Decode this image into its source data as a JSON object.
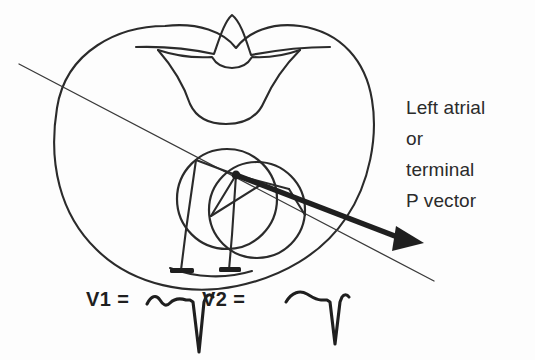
{
  "figure": {
    "background_color": "#fdfdfd",
    "ink_color": "#2b2b2b",
    "width": 535,
    "height": 360
  },
  "annotation": {
    "vector_label_lines": [
      "Left atrial",
      "or",
      "terminal",
      "P vector"
    ],
    "vector_label_text": "Left atrial or terminal P vector"
  },
  "leads": [
    {
      "name": "V1",
      "label": "V1  =",
      "electrode_position_x": 181,
      "electrode_position_y": 272,
      "waveform_description": "biphasic P wave with deep negative terminal deflection"
    },
    {
      "name": "V2",
      "label": "V2  =",
      "electrode_position_x": 229,
      "electrode_position_y": 272,
      "waveform_description": "rounded upright P wave with shallow negative deflection"
    }
  ],
  "anatomy": {
    "thorax_outline": "chest wall cross-section",
    "vertebra": "vertebral body with spinous process",
    "atria": [
      {
        "name": "right-atrium-circle",
        "cx": 227,
        "cy": 199,
        "r": 50
      },
      {
        "name": "left-atrium-circle",
        "cx": 257,
        "cy": 210,
        "r": 48
      }
    ],
    "vector_origin": {
      "x": 236,
      "y": 175
    }
  },
  "vectors": {
    "bold_arrow": {
      "name": "terminal-p-vector-arrow",
      "start_x": 236,
      "start_y": 175,
      "end_x": 412,
      "end_y": 243
    },
    "thin_axis_line": {
      "name": "frontal-plane-axis-line",
      "start_x": 19,
      "start_y": 64,
      "end_x": 434,
      "end_y": 281
    }
  }
}
